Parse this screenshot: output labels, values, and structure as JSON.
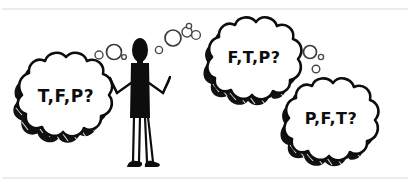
{
  "image": {
    "title": "Shrugging stick figure with three thought bubbles",
    "background_color": "#ffffff",
    "ink_color": "#0d0d0d",
    "frame_color": "#d8d8d8",
    "style": "hand-drawn black ink cartoon"
  },
  "figure": {
    "name": "shrugging-person",
    "pose_label": "shrug",
    "parts": {
      "head": "head",
      "torso": "torso",
      "left_arm": "left-arm",
      "right_arm": "right-arm",
      "left_leg": "left-leg",
      "right_leg": "right-leg",
      "left_shoe": "left-shoe",
      "right_shoe": "right-shoe"
    }
  },
  "thought_bubbles": [
    {
      "id": "bubble-left",
      "text": "T,F,P?",
      "position": "left",
      "font_size": 17
    },
    {
      "id": "bubble-top-right",
      "text": "F,T,P?",
      "position": "top-right",
      "font_size": 16
    },
    {
      "id": "bubble-bottom-right",
      "text": "P,F,T?",
      "position": "bottom-right",
      "font_size": 16
    }
  ],
  "trails": {
    "left_trail_label": "thought-trail-left",
    "center_trail_label": "thought-trail-center",
    "right_trail_label": "thought-trail-right"
  }
}
